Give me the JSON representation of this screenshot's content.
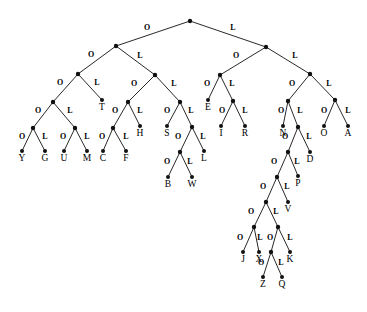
{
  "figure": {
    "name": "binary-code-tree",
    "type": "binary-tree-diagram",
    "edge_label_left": "O",
    "edge_label_right": "L",
    "colors": {
      "background": "#ffffff",
      "edge": "#111111",
      "node": "#111111",
      "text": "#000000"
    },
    "canvas": {
      "width": 367,
      "height": 312
    }
  },
  "nodes": [
    {
      "id": "root",
      "x": 190,
      "y": 21,
      "kind": "internal"
    },
    {
      "id": "n-O",
      "x": 116,
      "y": 46,
      "kind": "internal"
    },
    {
      "id": "n-L",
      "x": 266,
      "y": 47,
      "kind": "internal"
    },
    {
      "id": "n-OO",
      "x": 78,
      "y": 74,
      "kind": "internal"
    },
    {
      "id": "n-OL",
      "x": 155,
      "y": 75,
      "kind": "internal"
    },
    {
      "id": "n-LO",
      "x": 220,
      "y": 75,
      "kind": "internal"
    },
    {
      "id": "n-LL",
      "x": 310,
      "y": 74,
      "kind": "internal"
    },
    {
      "id": "n-OOO",
      "x": 53,
      "y": 102,
      "kind": "internal"
    },
    {
      "id": "n-OOL",
      "x": 102,
      "y": 100,
      "kind": "leaf",
      "letter": "T"
    },
    {
      "id": "n-OLO",
      "x": 128,
      "y": 102,
      "kind": "internal"
    },
    {
      "id": "n-OLL",
      "x": 180,
      "y": 102,
      "kind": "internal"
    },
    {
      "id": "n-LOO",
      "x": 208,
      "y": 100,
      "kind": "leaf",
      "letter": "E"
    },
    {
      "id": "n-LOL",
      "x": 233,
      "y": 101,
      "kind": "internal"
    },
    {
      "id": "n-LLO",
      "x": 288,
      "y": 101,
      "kind": "internal"
    },
    {
      "id": "n-LLL",
      "x": 335,
      "y": 100,
      "kind": "internal"
    },
    {
      "id": "n-OOOO",
      "x": 33,
      "y": 128,
      "kind": "internal"
    },
    {
      "id": "n-OOOL",
      "x": 75,
      "y": 128,
      "kind": "internal"
    },
    {
      "id": "n-OLOO",
      "x": 113,
      "y": 128,
      "kind": "internal"
    },
    {
      "id": "n-OLOL",
      "x": 140,
      "y": 126,
      "kind": "leaf",
      "letter": "H"
    },
    {
      "id": "n-OLLO",
      "x": 167,
      "y": 126,
      "kind": "leaf",
      "letter": "S"
    },
    {
      "id": "n-OLLL",
      "x": 192,
      "y": 127,
      "kind": "internal"
    },
    {
      "id": "n-LOLO",
      "x": 221,
      "y": 126,
      "kind": "leaf",
      "letter": "I"
    },
    {
      "id": "n-LOLL",
      "x": 245,
      "y": 126,
      "kind": "leaf",
      "letter": "R"
    },
    {
      "id": "n-LLOO",
      "x": 283,
      "y": 126,
      "kind": "leaf",
      "letter": "N"
    },
    {
      "id": "n-LLOL",
      "x": 298,
      "y": 127,
      "kind": "internal"
    },
    {
      "id": "n-LLLO",
      "x": 324,
      "y": 126,
      "kind": "leaf",
      "letter": "O"
    },
    {
      "id": "n-LLLL",
      "x": 348,
      "y": 126,
      "kind": "leaf",
      "letter": "A"
    },
    {
      "id": "n-OOOOO",
      "x": 22,
      "y": 151,
      "kind": "leaf",
      "letter": "Y"
    },
    {
      "id": "n-OOOOL",
      "x": 45,
      "y": 151,
      "kind": "leaf",
      "letter": "G"
    },
    {
      "id": "n-OOOLO",
      "x": 64,
      "y": 151,
      "kind": "leaf",
      "letter": "U"
    },
    {
      "id": "n-OOOLL",
      "x": 87,
      "y": 151,
      "kind": "leaf",
      "letter": "M"
    },
    {
      "id": "n-OLOOO",
      "x": 103,
      "y": 151,
      "kind": "leaf",
      "letter": "C"
    },
    {
      "id": "n-OLOOL",
      "x": 126,
      "y": 151,
      "kind": "leaf",
      "letter": "F"
    },
    {
      "id": "n-OLLLO",
      "x": 180,
      "y": 152,
      "kind": "internal"
    },
    {
      "id": "n-OLLLL",
      "x": 204,
      "y": 151,
      "kind": "leaf",
      "letter": "L"
    },
    {
      "id": "n-LLOLO",
      "x": 288,
      "y": 152,
      "kind": "internal"
    },
    {
      "id": "n-LLOLL",
      "x": 310,
      "y": 152,
      "kind": "leaf",
      "letter": "D"
    },
    {
      "id": "n-OLLLOO",
      "x": 168,
      "y": 177,
      "kind": "leaf",
      "letter": "B"
    },
    {
      "id": "n-OLLLOL",
      "x": 192,
      "y": 177,
      "kind": "leaf",
      "letter": "W"
    },
    {
      "id": "n-LLOLOO",
      "x": 277,
      "y": 177,
      "kind": "internal"
    },
    {
      "id": "n-LLOLOL",
      "x": 298,
      "y": 176,
      "kind": "leaf",
      "letter": "P"
    },
    {
      "id": "n-LLOLOOO",
      "x": 266,
      "y": 202,
      "kind": "internal"
    },
    {
      "id": "n-LLOLOOL",
      "x": 288,
      "y": 202,
      "kind": "leaf",
      "letter": "V"
    },
    {
      "id": "n-LLOLOOOO",
      "x": 254,
      "y": 227,
      "kind": "internal"
    },
    {
      "id": "n-LLOLOOOL",
      "x": 278,
      "y": 227,
      "kind": "internal"
    },
    {
      "id": "n-LLOLOOOOO",
      "x": 243,
      "y": 252,
      "kind": "leaf",
      "letter": "J"
    },
    {
      "id": "n-LLOLOOOOL",
      "x": 259,
      "y": 252,
      "kind": "leaf",
      "letter": "X"
    },
    {
      "id": "n-LLOLOOOLO",
      "x": 271,
      "y": 252,
      "kind": "internal"
    },
    {
      "id": "n-LLOLOOOLL",
      "x": 290,
      "y": 252,
      "kind": "leaf",
      "letter": "K"
    },
    {
      "id": "n-LLOLOOOLOO",
      "x": 263,
      "y": 277,
      "kind": "leaf",
      "letter": "Z"
    },
    {
      "id": "n-LLOLOOOLOL",
      "x": 282,
      "y": 277,
      "kind": "leaf",
      "letter": "Q"
    }
  ],
  "edges": [
    {
      "from": "root",
      "to": "n-O",
      "label": "O",
      "lx": 147,
      "ly": 30
    },
    {
      "from": "root",
      "to": "n-L",
      "label": "L",
      "lx": 233,
      "ly": 30
    },
    {
      "from": "n-O",
      "to": "n-OO",
      "label": "O",
      "lx": 91,
      "ly": 57
    },
    {
      "from": "n-O",
      "to": "n-OL",
      "label": "L",
      "lx": 140,
      "ly": 58
    },
    {
      "from": "n-L",
      "to": "n-LO",
      "label": "O",
      "lx": 236,
      "ly": 58
    },
    {
      "from": "n-L",
      "to": "n-LL",
      "label": "L",
      "lx": 295,
      "ly": 58
    },
    {
      "from": "n-OO",
      "to": "n-OOO",
      "label": "O",
      "lx": 60,
      "ly": 85
    },
    {
      "from": "n-OO",
      "to": "n-OOL",
      "label": "L",
      "lx": 97,
      "ly": 85
    },
    {
      "from": "n-OL",
      "to": "n-OLO",
      "label": "O",
      "lx": 134,
      "ly": 86
    },
    {
      "from": "n-OL",
      "to": "n-OLL",
      "label": "L",
      "lx": 174,
      "ly": 86
    },
    {
      "from": "n-LO",
      "to": "n-LOO",
      "label": "O",
      "lx": 207,
      "ly": 86
    },
    {
      "from": "n-LO",
      "to": "n-LOL",
      "label": "L",
      "lx": 232,
      "ly": 86
    },
    {
      "from": "n-LL",
      "to": "n-LLO",
      "label": "O",
      "lx": 292,
      "ly": 86
    },
    {
      "from": "n-LL",
      "to": "n-LLL",
      "label": "L",
      "lx": 329,
      "ly": 86
    },
    {
      "from": "n-OOO",
      "to": "n-OOOO",
      "label": "O",
      "lx": 38,
      "ly": 113
    },
    {
      "from": "n-OOO",
      "to": "n-OOOL",
      "label": "L",
      "lx": 70,
      "ly": 113
    },
    {
      "from": "n-OLO",
      "to": "n-OLOO",
      "label": "O",
      "lx": 115,
      "ly": 113
    },
    {
      "from": "n-OLO",
      "to": "n-OLOL",
      "label": "L",
      "lx": 140,
      "ly": 113
    },
    {
      "from": "n-OLL",
      "to": "n-OLLO",
      "label": "O",
      "lx": 167,
      "ly": 113
    },
    {
      "from": "n-OLL",
      "to": "n-OLLL",
      "label": "L",
      "lx": 191,
      "ly": 113
    },
    {
      "from": "n-LOL",
      "to": "n-LOLO",
      "label": "O",
      "lx": 222,
      "ly": 113
    },
    {
      "from": "n-LOL",
      "to": "n-LOLL",
      "label": "L",
      "lx": 245,
      "ly": 113
    },
    {
      "from": "n-LLO",
      "to": "n-LLOO",
      "label": "O",
      "lx": 281,
      "ly": 113
    },
    {
      "from": "n-LLO",
      "to": "n-LLOL",
      "label": "L",
      "lx": 300,
      "ly": 113
    },
    {
      "from": "n-LLL",
      "to": "n-LLLO",
      "label": "O",
      "lx": 324,
      "ly": 113
    },
    {
      "from": "n-LLL",
      "to": "n-LLLL",
      "label": "L",
      "lx": 348,
      "ly": 113
    },
    {
      "from": "n-OOOO",
      "to": "n-OOOOO",
      "label": "O",
      "lx": 22,
      "ly": 139
    },
    {
      "from": "n-OOOO",
      "to": "n-OOOOL",
      "label": "L",
      "lx": 45,
      "ly": 139
    },
    {
      "from": "n-OOOL",
      "to": "n-OOOLO",
      "label": "O",
      "lx": 63,
      "ly": 139
    },
    {
      "from": "n-OOOL",
      "to": "n-OOOLL",
      "label": "L",
      "lx": 87,
      "ly": 139
    },
    {
      "from": "n-OLOO",
      "to": "n-OLOOO",
      "label": "O",
      "lx": 102,
      "ly": 139
    },
    {
      "from": "n-OLOO",
      "to": "n-OLOOL",
      "label": "L",
      "lx": 126,
      "ly": 139
    },
    {
      "from": "n-OLLL",
      "to": "n-OLLLO",
      "label": "O",
      "lx": 178,
      "ly": 139
    },
    {
      "from": "n-OLLL",
      "to": "n-OLLLL",
      "label": "L",
      "lx": 203,
      "ly": 139
    },
    {
      "from": "n-LLOL",
      "to": "n-LLOLO",
      "label": "O",
      "lx": 285,
      "ly": 139
    },
    {
      "from": "n-LLOL",
      "to": "n-LLOLL",
      "label": "L",
      "lx": 309,
      "ly": 139
    },
    {
      "from": "n-OLLLO",
      "to": "n-OLLLOO",
      "label": "O",
      "lx": 167,
      "ly": 164
    },
    {
      "from": "n-OLLLO",
      "to": "n-OLLLOL",
      "label": "L",
      "lx": 190,
      "ly": 164
    },
    {
      "from": "n-LLOLO",
      "to": "n-LLOLOO",
      "label": "O",
      "lx": 274,
      "ly": 164
    },
    {
      "from": "n-LLOLO",
      "to": "n-LLOLOL",
      "label": "L",
      "lx": 297,
      "ly": 164
    },
    {
      "from": "n-LLOLOO",
      "to": "n-LLOLOOO",
      "label": "O",
      "lx": 263,
      "ly": 189
    },
    {
      "from": "n-LLOLOO",
      "to": "n-LLOLOOL",
      "label": "L",
      "lx": 287,
      "ly": 189
    },
    {
      "from": "n-LLOLOOO",
      "to": "n-LLOLOOOO",
      "label": "O",
      "lx": 251,
      "ly": 214
    },
    {
      "from": "n-LLOLOOO",
      "to": "n-LLOLOOOL",
      "label": "L",
      "lx": 276,
      "ly": 214
    },
    {
      "from": "n-LLOLOOOO",
      "to": "n-LLOLOOOOO",
      "label": "O",
      "lx": 240,
      "ly": 240
    },
    {
      "from": "n-LLOLOOOO",
      "to": "n-LLOLOOOOL",
      "label": "L",
      "lx": 260,
      "ly": 240
    },
    {
      "from": "n-LLOLOOOL",
      "to": "n-LLOLOOOLO",
      "label": "O",
      "lx": 270,
      "ly": 240
    },
    {
      "from": "n-LLOLOOOL",
      "to": "n-LLOLOOOLL",
      "label": "L",
      "lx": 290,
      "ly": 240
    },
    {
      "from": "n-LLOLOOOLO",
      "to": "n-LLOLOOOLOO",
      "label": "O",
      "lx": 261,
      "ly": 265
    },
    {
      "from": "n-LLOLOOOLOL",
      "to": "n-LLOLOOOLOL",
      "label": "",
      "lx": 0,
      "ly": 0
    },
    {
      "from": "n-LLOLOOOLO",
      "to": "n-LLOLOOOLOL",
      "label": "L",
      "lx": 281,
      "ly": 265
    }
  ],
  "leaf_letters": [
    "Y",
    "G",
    "U",
    "M",
    "T",
    "C",
    "F",
    "H",
    "S",
    "B",
    "W",
    "L",
    "E",
    "I",
    "R",
    "N",
    "D",
    "P",
    "V",
    "J",
    "X",
    "Z",
    "Q",
    "K",
    "O",
    "A"
  ]
}
